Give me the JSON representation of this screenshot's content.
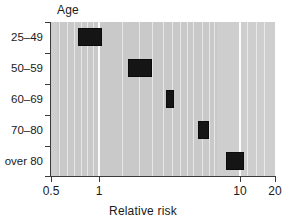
{
  "chart_data": {
    "type": "bar",
    "title": "",
    "xlabel": "Relative risk",
    "ylabel": "Age",
    "xscale": "log",
    "xlim": [
      0.5,
      20
    ],
    "xticks": [
      0.5,
      1,
      10,
      20
    ],
    "xtick_labels": [
      "0.5",
      "1",
      "10",
      "20"
    ],
    "grid": true,
    "legend": "none",
    "categories": [
      "25–49",
      "50–59",
      "60–69",
      "70–80",
      "over 80"
    ],
    "series": [
      {
        "name": "Relative risk interval",
        "intervals": [
          {
            "category": "25–49",
            "low": 0.78,
            "high": 1.15,
            "center": 0.95
          },
          {
            "category": "50–59",
            "low": 1.78,
            "high": 2.65,
            "center": 2.17
          },
          {
            "category": "60–69",
            "low": 3.3,
            "high": 3.8,
            "center": 3.54
          },
          {
            "category": "70–80",
            "low": 5.6,
            "high": 6.7,
            "center": 6.12
          },
          {
            "category": "over 80",
            "low": 8.9,
            "high": 12.0,
            "center": 10.3
          }
        ]
      }
    ],
    "colors": {
      "panel_background": "#c9c9c9",
      "gridline": "#ffffff",
      "box_fill": "#151515",
      "axis": "#3a3a3a",
      "text": "#1a1a1a"
    }
  },
  "axis": {
    "y_title": "Age",
    "x_title": "Relative risk",
    "y_categories": [
      "25–49",
      "50–59",
      "60–69",
      "70–80",
      "over 80"
    ],
    "x_tick_labels": [
      "0.5",
      "1",
      "10",
      "20"
    ]
  }
}
